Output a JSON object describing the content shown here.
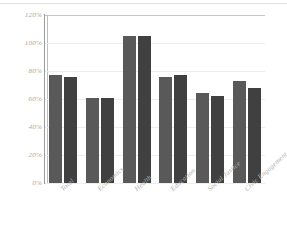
{
  "chart_data": {
    "type": "bar",
    "title": "",
    "xlabel": "",
    "ylabel": "",
    "ylim": [
      0,
      120
    ],
    "ytick_labels": [
      "0%",
      "20%",
      "40%",
      "60%",
      "80%",
      "100%",
      "120%"
    ],
    "ytick_values": [
      0,
      20,
      40,
      60,
      80,
      100,
      120
    ],
    "grid": true,
    "legend": "none",
    "categories": [
      "Total",
      "Economics",
      "Health",
      "Education",
      "Social Justice",
      "Civic Engagement"
    ],
    "series": [
      {
        "name": "Series 1",
        "color": "#595959",
        "values": [
          77,
          61,
          105,
          76,
          64,
          73
        ]
      },
      {
        "name": "Series 2",
        "color": "#404040",
        "values": [
          76,
          61,
          105,
          77,
          62,
          68
        ]
      }
    ],
    "value_suffix": "%"
  },
  "colors": {
    "series_1": "#595959",
    "series_2": "#404040",
    "gridline": "#ededed",
    "axis": "#9b9b9b",
    "tick_text": "#a6a6a6",
    "category_text": "#b0b0b0",
    "background": "#ffffff"
  }
}
